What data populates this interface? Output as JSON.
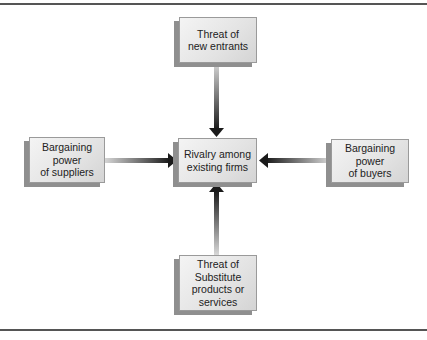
{
  "diagram": {
    "center": {
      "lines": [
        "Rivalry among",
        "existing firms"
      ]
    },
    "top": {
      "lines": [
        "Threat of",
        "new entrants"
      ]
    },
    "left": {
      "lines": [
        "Bargaining",
        "power",
        "of suppliers"
      ]
    },
    "right": {
      "lines": [
        "Bargaining",
        "power",
        "of buyers"
      ]
    },
    "bottom": {
      "lines": [
        "Threat of",
        "Substitute",
        "products or",
        "services"
      ]
    },
    "colors": {
      "rule": "#555555",
      "box_fill": "#e6e6e6",
      "box_shadow": "#8f8f8f",
      "arrow_dark": "#1a1a1a",
      "arrow_light": "#d8d8d8"
    }
  }
}
